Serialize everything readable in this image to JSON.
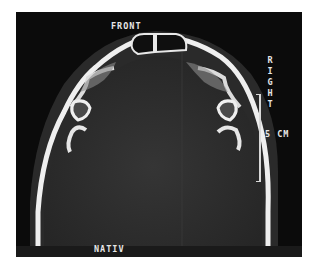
{
  "scan": {
    "orientation_top": "FRONT",
    "orientation_side": "RIGHT",
    "scale_label": "5 CM",
    "series_label": "NATIV"
  },
  "colors": {
    "background": "#0b0b0b",
    "bone": "#f2f2f2",
    "soft_tissue": "#2e2e2e",
    "text": "#e6e6e6"
  }
}
